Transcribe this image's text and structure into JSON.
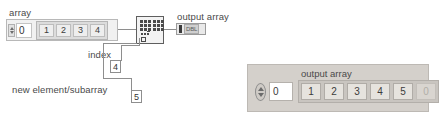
{
  "diagram": {
    "array_control": {
      "label": "array",
      "index_value": "0",
      "cells": [
        "1",
        "2",
        "3",
        "4"
      ]
    },
    "index_input": {
      "label": "index",
      "value": "4"
    },
    "new_element_input": {
      "label": "new element/subarray",
      "value": "5"
    },
    "node": {
      "name": "insert-into-array-node"
    },
    "output_terminal": {
      "label": "output array",
      "datatype": "DBL"
    }
  },
  "front_panel": {
    "title": "output array",
    "index_value": "0",
    "cells": [
      {
        "value": "1",
        "dim": false
      },
      {
        "value": "2",
        "dim": false
      },
      {
        "value": "3",
        "dim": false
      },
      {
        "value": "4",
        "dim": false
      },
      {
        "value": "5",
        "dim": false
      },
      {
        "value": "0",
        "dim": true
      }
    ]
  },
  "colors": {
    "wire": "#8e8e8e",
    "panel_bg": "#d4d0cb",
    "cell_bg": "#e6e3de",
    "node_border": "#5e5e5e"
  }
}
